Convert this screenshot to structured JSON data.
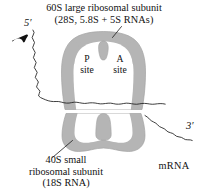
{
  "figure": {
    "title_top_line1": "60S large ribosomal subunit",
    "title_top_line2": "(28S, 5.8S + 5S RNAs)",
    "title_bottom_line1": "40S small",
    "title_bottom_line2": "ribosomal subunit",
    "title_bottom_line3": "(18S RNA)",
    "mrna_label": "mRNA",
    "five_prime_label": "5′",
    "three_prime_label": "3′",
    "p_site_letter": "P",
    "p_site_word": "site",
    "a_site_letter": "A",
    "a_site_word": "site"
  },
  "colors": {
    "subunit_fill": "#b5b5b5",
    "subunit_stroke": "#9a9a9a",
    "background": "#ffffff",
    "line": "#1a1a1a",
    "text": "#111111"
  }
}
